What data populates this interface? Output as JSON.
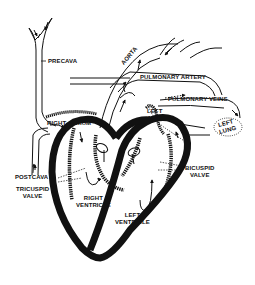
{
  "diagram": {
    "colors": {
      "ink": "#111111",
      "background": "#ffffff"
    },
    "labels": {
      "precava": "PRECAVA",
      "aorta": "AORTA",
      "pulmonary_artery": "PULMONARY ARTERY",
      "pulmonary_veins": "PULMONARY VEINS",
      "right_atrium": "RIGHT ATRIUM",
      "left_atrium_1": "LEFT",
      "left_atrium_2": "ATRIUM",
      "left_lung_1": "LEFT",
      "left_lung_2": "LUNG",
      "postcava": "POSTCAVA",
      "tricuspid_valve_1": "TRICUSPID",
      "tricuspid_valve_2": "VALVE",
      "bicuspid_valve_1": "BICUSPID",
      "bicuspid_valve_2": "VALVE",
      "right_ventricle_1": "RIGHT",
      "right_ventricle_2": "VENTRICLE",
      "left_ventricle_1": "LEFT",
      "left_ventricle_2": "VENTRICLE"
    }
  }
}
